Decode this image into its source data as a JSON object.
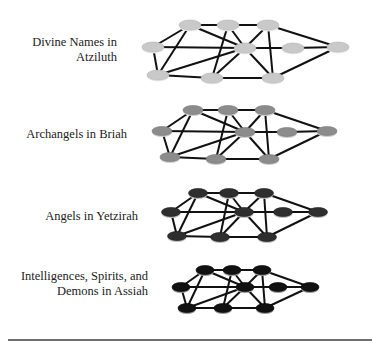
{
  "layers": [
    {
      "label_lines": [
        "Divine Names in",
        "Atziluth"
      ],
      "label_right": 117,
      "label_top": 35,
      "node_fill": "#c9c9c9",
      "node_rim": "#e9e9e9",
      "node_stroke": "#b5b5b5",
      "rx": 11,
      "ry": 5,
      "nodes": {
        "TL": [
          190,
          25
        ],
        "TM": [
          228,
          25
        ],
        "TR": [
          268,
          25
        ],
        "ML": [
          153,
          47
        ],
        "C": [
          245,
          48
        ],
        "MR": [
          293,
          48
        ],
        "FR": [
          338,
          47
        ],
        "BL": [
          158,
          75
        ],
        "BM": [
          212,
          78
        ],
        "BR": [
          273,
          78
        ]
      }
    },
    {
      "label_lines": [
        "Archangels in Briah"
      ],
      "label_right": 127,
      "label_top": 127,
      "node_fill": "#8c8c8c",
      "node_rim": "#cfcfcf",
      "node_stroke": "#777777",
      "rx": 10,
      "ry": 4.5,
      "nodes": {
        "TL": [
          193,
          110
        ],
        "TM": [
          228,
          110
        ],
        "TR": [
          265,
          110
        ],
        "ML": [
          162,
          131
        ],
        "C": [
          245,
          132
        ],
        "MR": [
          287,
          132
        ],
        "FR": [
          327,
          131
        ],
        "BL": [
          170,
          157
        ],
        "BM": [
          216,
          159
        ],
        "BR": [
          269,
          159
        ]
      }
    },
    {
      "label_lines": [
        "Angels in Yetzirah"
      ],
      "label_right": 138,
      "label_top": 209,
      "node_fill": "#2e2e2e",
      "node_rim": "#bdbdbd",
      "node_stroke": "#1a1a1a",
      "rx": 9.5,
      "ry": 4.5,
      "nodes": {
        "TL": [
          198,
          193
        ],
        "TM": [
          229,
          193
        ],
        "TR": [
          264,
          193
        ],
        "ML": [
          171,
          212
        ],
        "C": [
          244,
          212
        ],
        "MR": [
          283,
          212
        ],
        "FR": [
          318,
          212
        ],
        "BL": [
          177,
          236
        ],
        "BM": [
          220,
          237
        ],
        "BR": [
          267,
          237
        ]
      }
    },
    {
      "label_lines": [
        "Intelligences, Spirits, and",
        "Demons in Assiah"
      ],
      "label_right": 148,
      "label_top": 269,
      "node_fill": "#111111",
      "node_rim": "#9a9a9a",
      "node_stroke": "#000000",
      "rx": 9,
      "ry": 4.5,
      "nodes": {
        "TL": [
          205,
          270
        ],
        "TM": [
          232,
          270
        ],
        "TR": [
          262,
          270
        ],
        "ML": [
          181,
          287
        ],
        "C": [
          245,
          287
        ],
        "MR": [
          278,
          287
        ],
        "FR": [
          310,
          287
        ],
        "BL": [
          187,
          308
        ],
        "BM": [
          223,
          308
        ],
        "BR": [
          265,
          308
        ]
      }
    }
  ],
  "edges": [
    [
      "TL",
      "TM"
    ],
    [
      "TM",
      "TR"
    ],
    [
      "TL",
      "ML"
    ],
    [
      "TL",
      "BL"
    ],
    [
      "TL",
      "C"
    ],
    [
      "ML",
      "C"
    ],
    [
      "ML",
      "BL"
    ],
    [
      "BL",
      "BM"
    ],
    [
      "BM",
      "BR"
    ],
    [
      "BL",
      "C"
    ],
    [
      "TM",
      "BM"
    ],
    [
      "TM",
      "C"
    ],
    [
      "C",
      "BM"
    ],
    [
      "C",
      "BR"
    ],
    [
      "C",
      "TR"
    ],
    [
      "TR",
      "BR"
    ],
    [
      "TR",
      "FR"
    ],
    [
      "C",
      "MR"
    ],
    [
      "MR",
      "FR"
    ],
    [
      "BR",
      "FR"
    ]
  ],
  "edge_color": "#111111",
  "rule_color": "#6e6e6e"
}
